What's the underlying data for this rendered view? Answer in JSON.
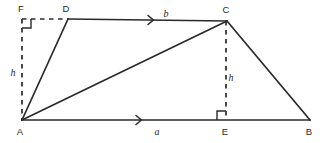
{
  "figure": {
    "type": "trapezoid-with-heights-diagram",
    "background_color": "#ffffff",
    "stroke_color": "#2a2a2a",
    "vertices": {
      "A": {
        "label": "A",
        "x": 22,
        "y": 120,
        "label_x": 20,
        "label_y": 135
      },
      "B": {
        "label": "B",
        "x": 310,
        "y": 120,
        "label_x": 309,
        "label_y": 135
      },
      "C": {
        "label": "C",
        "x": 227,
        "y": 21,
        "label_x": 226,
        "label_y": 13
      },
      "D": {
        "label": "D",
        "x": 68,
        "y": 19,
        "label_x": 66,
        "label_y": 12
      },
      "E": {
        "label": "E",
        "x": 226,
        "y": 120,
        "label_x": 225,
        "label_y": 135
      },
      "F": {
        "label": "F",
        "x": 22,
        "y": 19,
        "label_x": 21,
        "label_y": 12
      }
    },
    "measures": {
      "side_b": {
        "label": "b",
        "x": 166,
        "y": 17
      },
      "side_a": {
        "label": "a",
        "x": 157,
        "y": 135
      },
      "height_left": {
        "label": "h",
        "x": 13,
        "y": 76
      },
      "height_right": {
        "label": "h",
        "x": 231,
        "y": 81
      }
    },
    "solid_edges": [
      {
        "name": "edge-A-D",
        "from": "A",
        "to": "D"
      },
      {
        "name": "edge-D-C",
        "from": "D",
        "to": "C"
      },
      {
        "name": "edge-C-B",
        "from": "C",
        "to": "B"
      },
      {
        "name": "edge-A-B",
        "from": "A",
        "to": "B"
      },
      {
        "name": "edge-A-C",
        "from": "A",
        "to": "C"
      }
    ],
    "dashed_edges": [
      {
        "name": "edge-F-D",
        "from": "F",
        "to": "D"
      },
      {
        "name": "edge-F-A",
        "from": "F",
        "to": "A"
      },
      {
        "name": "edge-C-E",
        "from": "C",
        "to": "E"
      }
    ],
    "right_angles": [
      {
        "name": "right-angle-F",
        "at": "F",
        "size": 9,
        "dir_x": 1,
        "dir_y": 1
      },
      {
        "name": "right-angle-E",
        "at": "E",
        "size": 9,
        "dir_x": -1,
        "dir_y": -1
      }
    ],
    "direction_arrows": [
      {
        "name": "arrow-dc",
        "x": 152,
        "y": 20,
        "size": 4.5
      },
      {
        "name": "arrow-ab",
        "x": 140,
        "y": 120,
        "size": 4.5
      }
    ]
  }
}
